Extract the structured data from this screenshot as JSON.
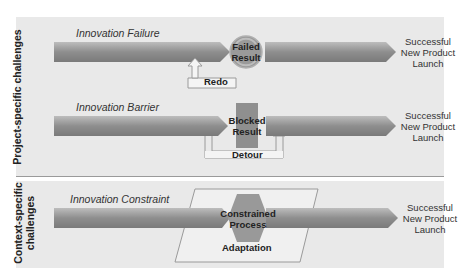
{
  "sections": {
    "project": {
      "label": "Project-specific challenges"
    },
    "context": {
      "label_line1": "Context-specific",
      "label_line2": "challenges"
    }
  },
  "rows": [
    {
      "title": "Innovation Failure",
      "center_line1": "Failed",
      "center_line2": "Result",
      "loop_label": "Redo",
      "outcome_line1": "Successful",
      "outcome_line2": "New Product",
      "outcome_line3": "Launch"
    },
    {
      "title": "Innovation Barrier",
      "center_line1": "Blocked",
      "center_line2": "Result",
      "loop_label": "Detour",
      "outcome_line1": "Successful",
      "outcome_line2": "New Product",
      "outcome_line3": "Launch"
    },
    {
      "title": "Innovation Constraint",
      "center_line1": "Constrained",
      "center_line2": "Process",
      "loop_label": "Adaptation",
      "outcome_line1": "Successful",
      "outcome_line2": "New Product",
      "outcome_line3": "Launch"
    }
  ],
  "colors": {
    "panel_bg": "#e9e9e9",
    "arrow_dark": "#7a7a7a",
    "arrow_light": "#c8c8c8",
    "obstacle": "#8f8f8f"
  }
}
